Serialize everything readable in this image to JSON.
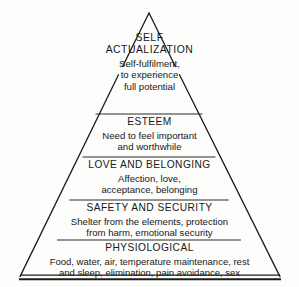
{
  "figure": {
    "name": "Maslow's Hierarchy of Needs",
    "shape": "pyramid",
    "level_count": 5,
    "colors": {
      "background": "#fdfdfb",
      "line": "#1b1b1b",
      "text": "#17181a"
    },
    "geometry": {
      "apex_x": 149,
      "apex_y": 13,
      "base_left_x": 20,
      "base_right_x": 280,
      "base_y": 277,
      "divider_y": [
        114,
        157,
        200,
        240
      ]
    }
  },
  "levels": [
    {
      "index": 1,
      "heading_lines": [
        "SELF",
        "ACTUALIZATION"
      ],
      "description_lines": [
        "Self-fulfilment,",
        "to experience",
        "full potential"
      ]
    },
    {
      "index": 2,
      "heading_lines": [
        "ESTEEM"
      ],
      "description_lines": [
        "Need to feel important",
        "and worthwhile"
      ]
    },
    {
      "index": 3,
      "heading_lines": [
        "LOVE AND BELONGING"
      ],
      "description_lines": [
        "Affection, love,",
        "acceptance, belonging"
      ]
    },
    {
      "index": 4,
      "heading_lines": [
        "SAFETY AND SECURITY"
      ],
      "description_lines": [
        "Shelter from the elements, protection",
        "from harm, emotional security"
      ]
    },
    {
      "index": 5,
      "heading_lines": [
        "PHYSIOLOGICAL"
      ],
      "description_lines": [
        "Food, water, air, temperature maintenance, rest",
        "and sleep, elimination, pain avoidance, sex"
      ]
    }
  ]
}
